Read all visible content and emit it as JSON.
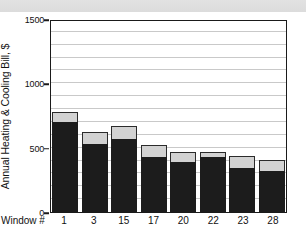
{
  "banner": {
    "label": ""
  },
  "chart_data": {
    "type": "bar",
    "subtype": "stacked-bar",
    "title": "",
    "xlabel": "Window #",
    "ylabel": "Annual Heating & Cooling Bill, $",
    "categories": [
      "1",
      "3",
      "15",
      "17",
      "20",
      "22",
      "23",
      "28"
    ],
    "series": [
      {
        "name": "lower-segment",
        "color": "#1c1c1c",
        "values": [
          700,
          530,
          570,
          430,
          390,
          425,
          345,
          315
        ]
      },
      {
        "name": "upper-segment",
        "color": "#d2d2d2",
        "values": [
          80,
          90,
          100,
          90,
          80,
          45,
          90,
          90
        ]
      }
    ],
    "totals": [
      780,
      620,
      670,
      520,
      470,
      470,
      435,
      405
    ],
    "ylim": [
      0,
      1500
    ],
    "ytick_labels": [
      "0",
      "500",
      "1000",
      "1500"
    ],
    "ytick_values": [
      0,
      500,
      1000,
      1500
    ],
    "gridlines": [
      100,
      200,
      300,
      400,
      500,
      600,
      700,
      800,
      900,
      1000,
      1100,
      1200,
      1300,
      1400
    ],
    "grid": true,
    "legend": "none"
  }
}
